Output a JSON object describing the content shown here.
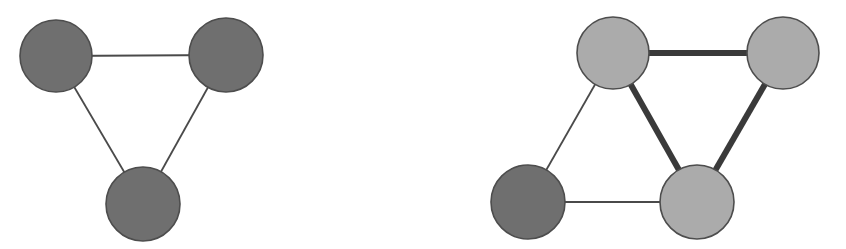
{
  "figure": {
    "width": 846,
    "height": 249,
    "background": "#ffffff",
    "caption": ""
  },
  "palette": {
    "node_dark": "#6f6f6f",
    "node_light": "#ababab",
    "node_stroke": "#4d4d4d",
    "edge_thin": "#4a4a4a",
    "edge_thick": "#3a3a3a",
    "background": "#ffffff"
  },
  "chart_data": {
    "type": "diagram",
    "title": "",
    "xlabel": "",
    "ylabel": "",
    "graphs": [
      {
        "name": "left-graph",
        "label": "",
        "node_count": 3,
        "edge_count": 3,
        "nodes": [
          {
            "id": "L1",
            "label": "",
            "x": 56,
            "y": 56,
            "r": 36,
            "fill": "#6f6f6f",
            "state": "dark"
          },
          {
            "id": "L2",
            "label": "",
            "x": 226,
            "y": 55,
            "r": 37,
            "fill": "#6f6f6f",
            "state": "dark"
          },
          {
            "id": "L3",
            "label": "",
            "x": 143,
            "y": 204,
            "r": 37,
            "fill": "#6f6f6f",
            "state": "dark"
          }
        ],
        "edges": [
          {
            "source": "L1",
            "target": "L2",
            "weight": 1,
            "width": 1.8,
            "style": "thin"
          },
          {
            "source": "L1",
            "target": "L3",
            "weight": 1,
            "width": 1.8,
            "style": "thin"
          },
          {
            "source": "L2",
            "target": "L3",
            "weight": 1,
            "width": 1.8,
            "style": "thin"
          }
        ]
      },
      {
        "name": "right-graph",
        "label": "",
        "node_count": 4,
        "edge_count": 5,
        "nodes": [
          {
            "id": "R1",
            "label": "",
            "x": 613,
            "y": 53,
            "r": 36,
            "fill": "#ababab",
            "state": "light"
          },
          {
            "id": "R2",
            "label": "",
            "x": 783,
            "y": 53,
            "r": 36,
            "fill": "#ababab",
            "state": "light"
          },
          {
            "id": "R3",
            "label": "",
            "x": 528,
            "y": 202,
            "r": 37,
            "fill": "#6f6f6f",
            "state": "dark"
          },
          {
            "id": "R4",
            "label": "",
            "x": 697,
            "y": 202,
            "r": 37,
            "fill": "#ababab",
            "state": "light"
          }
        ],
        "edges": [
          {
            "source": "R1",
            "target": "R2",
            "weight": 3,
            "width": 6,
            "style": "thick"
          },
          {
            "source": "R1",
            "target": "R4",
            "weight": 3,
            "width": 6,
            "style": "thick"
          },
          {
            "source": "R2",
            "target": "R4",
            "weight": 3,
            "width": 6,
            "style": "thick"
          },
          {
            "source": "R1",
            "target": "R3",
            "weight": 1,
            "width": 1.8,
            "style": "thin"
          },
          {
            "source": "R3",
            "target": "R4",
            "weight": 1,
            "width": 1.8,
            "style": "thin"
          }
        ]
      }
    ]
  }
}
